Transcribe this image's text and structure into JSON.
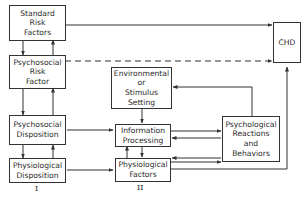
{
  "diagram": {
    "nodes": {
      "standard_risk": "Standard\nRisk\nFactors",
      "psychosocial_risk": "Psychosocial\nRisk\nFactor",
      "psychosocial_disposition": "Psychosocial\nDisposition",
      "physiological_disposition": "Physiological\nDisposition",
      "environmental": "Environmental\nor\nStimulus\nSetting",
      "information_processing": "Information\nProcessing",
      "physiological_factors": "Physiological\nFactors",
      "psychological_reactions": "Psychological\nReactions\nand\nBehaviors",
      "chd": "CHD"
    },
    "labels": {
      "stage_1": "I",
      "stage_2": "II"
    },
    "edges": [
      {
        "from": "Standard Risk Factors",
        "to": "CHD",
        "style": "solid"
      },
      {
        "from": "Psychosocial Risk Factor",
        "to": "CHD",
        "style": "dashed"
      },
      {
        "from": "Standard Risk Factors",
        "to": "Psychosocial Risk Factor",
        "style": "solid",
        "bidirectional": true
      },
      {
        "from": "Psychosocial Risk Factor",
        "to": "Psychosocial Disposition",
        "style": "solid",
        "bidirectional": true
      },
      {
        "from": "Psychosocial Disposition",
        "to": "Physiological Disposition",
        "style": "solid",
        "bidirectional": true
      },
      {
        "from": "Psychosocial Disposition",
        "to": "Information Processing",
        "style": "solid"
      },
      {
        "from": "Physiological Disposition",
        "to": "Physiological Factors",
        "style": "solid"
      },
      {
        "from": "Environmental or Stimulus Setting",
        "to": "Information Processing",
        "style": "solid"
      },
      {
        "from": "Psychological Reactions and Behaviors",
        "to": "Environmental or Stimulus Setting",
        "style": "solid"
      },
      {
        "from": "Information Processing",
        "to": "Psychological Reactions and Behaviors",
        "style": "solid",
        "bidirectional": true
      },
      {
        "from": "Physiological Factors",
        "to": "Psychological Reactions and Behaviors",
        "style": "solid",
        "bidirectional": true
      },
      {
        "from": "Physiological Factors",
        "to": "Information Processing",
        "style": "solid",
        "bidirectional": true
      },
      {
        "from": "Physiological Factors",
        "to": "CHD",
        "style": "solid"
      }
    ]
  }
}
